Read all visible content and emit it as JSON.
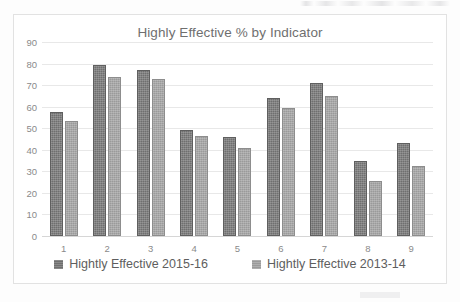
{
  "chart_data": {
    "type": "bar",
    "title": "Highly Effective % by Indicator",
    "xlabel": "",
    "ylabel": "",
    "categories": [
      "1",
      "2",
      "3",
      "4",
      "5",
      "6",
      "7",
      "8",
      "9"
    ],
    "series": [
      {
        "name": "Hightly Effective 2015-16",
        "color": "#6f6f6f",
        "values": [
          57.5,
          79.5,
          77,
          49,
          46,
          64,
          71,
          35,
          43
        ]
      },
      {
        "name": "Hightly Effective 2013-14",
        "color": "#9a9a9a",
        "values": [
          53.5,
          74,
          73,
          46.5,
          41,
          59.5,
          65,
          25.5,
          32.5
        ]
      }
    ],
    "ylim": [
      0,
      90
    ],
    "ytick_labels": [
      "90",
      "80",
      "70",
      "60",
      "50",
      "40",
      "30",
      "20",
      "10",
      "0"
    ],
    "ytick_values": [
      90,
      80,
      70,
      60,
      50,
      40,
      30,
      20,
      10,
      0
    ],
    "grid": true,
    "legend_position": "bottom"
  }
}
